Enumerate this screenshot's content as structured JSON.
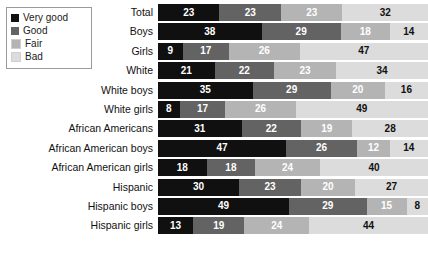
{
  "legend": {
    "items": [
      {
        "label": "Very good",
        "color": "#101010"
      },
      {
        "label": "Good",
        "color": "#636363"
      },
      {
        "label": "Fair",
        "color": "#b4b4b4"
      },
      {
        "label": "Bad",
        "color": "#dcdcdc"
      }
    ]
  },
  "chart_data": {
    "type": "bar",
    "orientation": "horizontal",
    "stacked": true,
    "stack_mode": "percent",
    "title": "",
    "subtitle": "",
    "xlabel": "",
    "ylabel": "",
    "xlim": [
      0,
      100
    ],
    "grid": false,
    "legend_position": "top-left",
    "legend_entries": [
      "Very good",
      "Good",
      "Fair",
      "Bad"
    ],
    "series_colors": [
      "#101010",
      "#636363",
      "#b4b4b4",
      "#dcdcdc"
    ],
    "value_text_colors": [
      "#ffffff",
      "#ffffff",
      "#ffffff",
      "#111111"
    ],
    "categories": [
      "Total",
      "Boys",
      "Girls",
      "White",
      "White boys",
      "White girls",
      "African Americans",
      "African American boys",
      "African American girls",
      "Hispanic",
      "Hispanic boys",
      "Hispanic girls"
    ],
    "series": [
      {
        "name": "Very good",
        "values": [
          23,
          38,
          9,
          21,
          35,
          8,
          31,
          47,
          18,
          30,
          49,
          13
        ]
      },
      {
        "name": "Good",
        "values": [
          23,
          29,
          17,
          22,
          29,
          17,
          22,
          26,
          18,
          23,
          29,
          19
        ]
      },
      {
        "name": "Fair",
        "values": [
          23,
          18,
          26,
          23,
          20,
          26,
          19,
          12,
          24,
          20,
          15,
          24
        ]
      },
      {
        "name": "Bad",
        "values": [
          32,
          14,
          47,
          34,
          16,
          49,
          28,
          14,
          40,
          27,
          8,
          44
        ]
      }
    ],
    "rows": [
      {
        "label": "Total",
        "values": [
          23,
          23,
          23,
          32
        ]
      },
      {
        "label": "Boys",
        "values": [
          38,
          29,
          18,
          14
        ]
      },
      {
        "label": "Girls",
        "values": [
          9,
          17,
          26,
          47
        ]
      },
      {
        "label": "White",
        "values": [
          21,
          22,
          23,
          34
        ]
      },
      {
        "label": "White boys",
        "values": [
          35,
          29,
          20,
          16
        ]
      },
      {
        "label": "White girls",
        "values": [
          8,
          17,
          26,
          49
        ]
      },
      {
        "label": "African Americans",
        "values": [
          31,
          22,
          19,
          28
        ]
      },
      {
        "label": "African American boys",
        "values": [
          47,
          26,
          12,
          14
        ]
      },
      {
        "label": "African American girls",
        "values": [
          18,
          18,
          24,
          40
        ]
      },
      {
        "label": "Hispanic",
        "values": [
          30,
          23,
          20,
          27
        ]
      },
      {
        "label": "Hispanic boys",
        "values": [
          49,
          29,
          15,
          8
        ]
      },
      {
        "label": "Hispanic girls",
        "values": [
          13,
          19,
          24,
          44
        ]
      }
    ]
  }
}
